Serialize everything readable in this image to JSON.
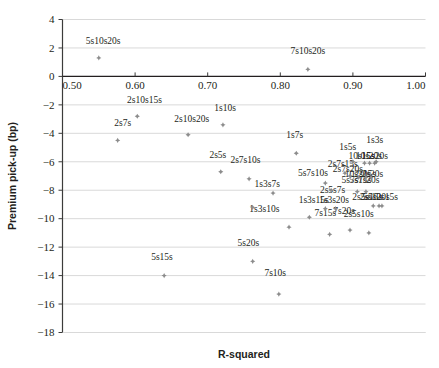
{
  "chart_data": {
    "type": "scatter",
    "title": "",
    "xlabel": "R-squared",
    "ylabel": "Premium pick-up (bp)",
    "xlim": [
      0.5,
      1.0
    ],
    "ylim": [
      -18,
      4
    ],
    "xticks": [
      "0.50",
      "0.60",
      "0.70",
      "0.80",
      "0.90",
      "1.00"
    ],
    "xtick_values": [
      0.5,
      0.6,
      0.7,
      0.8,
      0.9,
      1.0
    ],
    "yticks": [
      "4",
      "2",
      "0",
      "-2",
      "-4",
      "-6",
      "-8",
      "-10",
      "-12",
      "-14",
      "-16",
      "-18"
    ],
    "ytick_values": [
      4,
      2,
      0,
      -2,
      -4,
      -6,
      -8,
      -10,
      -12,
      -14,
      -16,
      -18
    ],
    "grid": "horizontal",
    "legend": "none",
    "marker_color": "#8c8c8c",
    "points": [
      {
        "label": "5s10s20s",
        "x": 0.55,
        "y": 1.3,
        "lx": 0.556,
        "ly": 2.3,
        "anchor": "middle"
      },
      {
        "label": "7s10s20s",
        "x": 0.838,
        "y": 0.5,
        "lx": 0.838,
        "ly": 1.6,
        "anchor": "middle"
      },
      {
        "label": "2s10s15s",
        "x": 0.603,
        "y": -2.8,
        "lx": 0.613,
        "ly": -1.9,
        "anchor": "middle"
      },
      {
        "label": "2s7s",
        "x": 0.576,
        "y": -4.5,
        "lx": 0.583,
        "ly": -3.5,
        "anchor": "middle"
      },
      {
        "label": "2s10s20s",
        "x": 0.673,
        "y": -4.1,
        "lx": 0.678,
        "ly": -3.2,
        "anchor": "middle"
      },
      {
        "label": "1s10s",
        "x": 0.721,
        "y": -3.4,
        "lx": 0.724,
        "ly": -2.4,
        "anchor": "middle"
      },
      {
        "label": "2s5s",
        "x": 0.718,
        "y": -6.7,
        "lx": 0.714,
        "ly": -5.7,
        "anchor": "middle"
      },
      {
        "label": "2s7s10s",
        "x": 0.757,
        "y": -7.2,
        "lx": 0.752,
        "ly": -6.1,
        "anchor": "middle"
      },
      {
        "label": "1s7s",
        "x": 0.822,
        "y": -5.4,
        "lx": 0.82,
        "ly": -4.3,
        "anchor": "middle"
      },
      {
        "label": "5s7s10s",
        "x": 0.862,
        "y": -7.5,
        "lx": 0.845,
        "ly": -7.0,
        "anchor": "middle"
      },
      {
        "label": "1s3s7s",
        "x": 0.79,
        "y": -8.2,
        "lx": 0.782,
        "ly": -7.8,
        "anchor": "middle"
      },
      {
        "label": "1s3s10s",
        "x": 0.762,
        "y": -9.2,
        "lx": 0.778,
        "ly": -9.5,
        "anchor": "middle"
      },
      {
        "label": "2s5s7s",
        "x": 0.87,
        "y": -8.0,
        "lx": 0.872,
        "ly": -8.2,
        "anchor": "middle"
      },
      {
        "label": "1s3s15s",
        "x": 0.862,
        "y": -9.3,
        "lx": 0.846,
        "ly": -8.9,
        "anchor": "middle"
      },
      {
        "label": "1s3s20s",
        "x": 0.876,
        "y": -9.3,
        "lx": 0.874,
        "ly": -8.9,
        "anchor": "middle"
      },
      {
        "label": "1s5s",
        "x": 0.9,
        "y": -6.0,
        "lx": 0.893,
        "ly": -5.2,
        "anchor": "middle"
      },
      {
        "label": "1s3s",
        "x": 0.932,
        "y": -6.0,
        "lx": 0.93,
        "ly": -4.7,
        "anchor": "middle"
      },
      {
        "label": "10s15s",
        "x": 0.916,
        "y": -6.1,
        "lx": 0.912,
        "ly": -5.8,
        "anchor": "middle"
      },
      {
        "label": "10s20s",
        "x": 0.923,
        "y": -6.1,
        "lx": 0.922,
        "ly": -5.8,
        "anchor": "middle"
      },
      {
        "label": "15s20s",
        "x": 0.93,
        "y": -6.1,
        "lx": 0.93,
        "ly": -5.8,
        "anchor": "middle"
      },
      {
        "label": "2s7s15s",
        "x": 0.889,
        "y": -6.8,
        "lx": 0.886,
        "ly": -6.4,
        "anchor": "middle"
      },
      {
        "label": "2s7s20s",
        "x": 0.896,
        "y": -7.0,
        "lx": 0.893,
        "ly": -6.7,
        "anchor": "middle"
      },
      {
        "label": "10s20s",
        "x": 0.908,
        "y": -7.1,
        "lx": 0.907,
        "ly": -7.1,
        "anchor": "middle"
      },
      {
        "label": "2s15s",
        "x": 0.918,
        "y": -7.1,
        "lx": 0.917,
        "ly": -7.1,
        "anchor": "middle"
      },
      {
        "label": "2s20s",
        "x": 0.925,
        "y": -7.1,
        "lx": 0.927,
        "ly": -7.1,
        "anchor": "middle"
      },
      {
        "label": "5s7s15s",
        "x": 0.906,
        "y": -8.1,
        "lx": 0.905,
        "ly": -7.5,
        "anchor": "middle"
      },
      {
        "label": "5s7s20s",
        "x": 0.918,
        "y": -8.1,
        "lx": 0.916,
        "ly": -7.5,
        "anchor": "middle"
      },
      {
        "label": "2s5s15s",
        "x": 0.928,
        "y": -9.1,
        "lx": 0.92,
        "ly": -8.7,
        "anchor": "middle"
      },
      {
        "label": "2s5s20s",
        "x": 0.936,
        "y": -9.1,
        "lx": 0.93,
        "ly": -8.7,
        "anchor": "middle"
      },
      {
        "label": "5s10s15s",
        "x": 0.94,
        "y": -9.1,
        "lx": 0.938,
        "ly": -8.7,
        "anchor": "middle"
      },
      {
        "label": "7s15s",
        "x": 0.868,
        "y": -11.1,
        "lx": 0.862,
        "ly": -9.8,
        "anchor": "middle"
      },
      {
        "label": "7s20s",
        "x": 0.896,
        "y": -10.8,
        "lx": 0.888,
        "ly": -9.7,
        "anchor": "middle"
      },
      {
        "label": "2s5s10s",
        "x": 0.922,
        "y": -11.0,
        "lx": 0.908,
        "ly": -9.9,
        "anchor": "middle"
      },
      {
        "label": "5s20s",
        "x": 0.762,
        "y": -13.0,
        "lx": 0.756,
        "ly": -11.9,
        "anchor": "middle"
      },
      {
        "label": "5s15s",
        "x": 0.64,
        "y": -14.0,
        "lx": 0.637,
        "ly": -12.9,
        "anchor": "middle"
      },
      {
        "label": "7s10s",
        "x": 0.798,
        "y": -15.3,
        "lx": 0.793,
        "ly": -14.0,
        "anchor": "middle"
      },
      {
        "label": "",
        "x": 0.84,
        "y": -9.9,
        "lx": 0.84,
        "ly": -9.9,
        "anchor": "middle"
      },
      {
        "label": "",
        "x": 0.812,
        "y": -10.6,
        "lx": 0.812,
        "ly": -10.6,
        "anchor": "middle"
      }
    ]
  }
}
